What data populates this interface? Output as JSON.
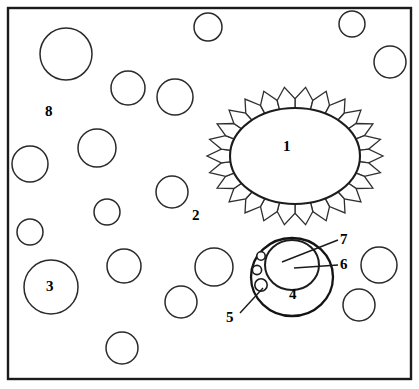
{
  "figure": {
    "background_color": "#ffffff",
    "ink_color": "#1a1a1a",
    "frame": {
      "x": 8,
      "y": 8,
      "width": 403,
      "height": 371
    }
  },
  "labels": [
    {
      "id": "1",
      "text": "1",
      "x": 288,
      "y": 147,
      "role": "central-nucleus",
      "leader": false
    },
    {
      "id": "2",
      "text": "2",
      "x": 197,
      "y": 216,
      "role": "radiating-petal-layer",
      "leader": false
    },
    {
      "id": "3",
      "text": "3",
      "x": 51,
      "y": 287,
      "role": "large-vacuole",
      "leader": false
    },
    {
      "id": "4",
      "text": "4",
      "x": 294,
      "y": 295,
      "role": "cell-body",
      "leader": false
    },
    {
      "id": "5",
      "text": "5",
      "x": 231,
      "y": 318,
      "role": "granule",
      "leader": true
    },
    {
      "id": "6",
      "text": "6",
      "x": 345,
      "y": 265,
      "role": "nucleolus-region",
      "leader": true
    },
    {
      "id": "7",
      "text": "7",
      "x": 345,
      "y": 240,
      "role": "nucleus-membrane",
      "leader": true
    },
    {
      "id": "8",
      "text": "8",
      "x": 50,
      "y": 112,
      "role": "matrix-background",
      "leader": false
    }
  ],
  "vacuoles": [
    {
      "cx": 66,
      "cy": 54,
      "r": 26
    },
    {
      "cx": 128,
      "cy": 88,
      "r": 17
    },
    {
      "cx": 175,
      "cy": 97,
      "r": 18
    },
    {
      "cx": 208,
      "cy": 27,
      "r": 14
    },
    {
      "cx": 352,
      "cy": 24,
      "r": 13
    },
    {
      "cx": 390,
      "cy": 62,
      "r": 16
    },
    {
      "cx": 97,
      "cy": 148,
      "r": 19
    },
    {
      "cx": 30,
      "cy": 164,
      "r": 18
    },
    {
      "cx": 172,
      "cy": 192,
      "r": 16
    },
    {
      "cx": 107,
      "cy": 212,
      "r": 13
    },
    {
      "cx": 30,
      "cy": 232,
      "r": 13
    },
    {
      "cx": 51,
      "cy": 287,
      "r": 27
    },
    {
      "cx": 124,
      "cy": 266,
      "r": 17
    },
    {
      "cx": 214,
      "cy": 267,
      "r": 19
    },
    {
      "cx": 181,
      "cy": 302,
      "r": 16
    },
    {
      "cx": 122,
      "cy": 348,
      "r": 16
    },
    {
      "cx": 379,
      "cy": 265,
      "r": 18
    },
    {
      "cx": 359,
      "cy": 305,
      "r": 16
    }
  ],
  "central_structure": {
    "name": "petalled-nucleus",
    "nucleus": {
      "cx": 295,
      "cy": 156,
      "rx": 65,
      "ry": 48
    },
    "petal_count": 26,
    "petal_length": 23
  },
  "cell_structure": {
    "name": "granular-cell",
    "body": {
      "cx": 292,
      "cy": 277,
      "rx": 41,
      "ry": 39
    },
    "nucleus": {
      "cx": 292,
      "cy": 265,
      "rx": 27,
      "ry": 25
    },
    "granules": [
      {
        "cx": 261,
        "cy": 256,
        "r": 4.2
      },
      {
        "cx": 257,
        "cy": 270,
        "r": 4.6
      },
      {
        "cx": 261,
        "cy": 285,
        "r": 6.2
      }
    ]
  },
  "leader_lines": [
    {
      "for": "5",
      "x1": 240,
      "y1": 313,
      "x2": 263,
      "y2": 288
    },
    {
      "for": "6",
      "x1": 338,
      "y1": 265,
      "x2": 294,
      "y2": 268
    },
    {
      "for": "7",
      "x1": 338,
      "y1": 240,
      "x2": 282,
      "y2": 262
    }
  ]
}
